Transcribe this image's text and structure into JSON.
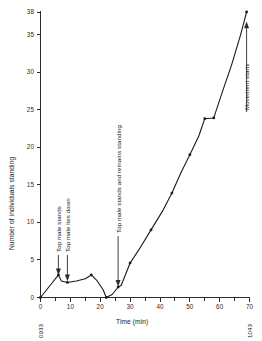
{
  "chart_data": {
    "type": "line",
    "title": "",
    "xlabel": "Time (min)",
    "ylabel": "Number of individuals standing",
    "xlim": [
      0,
      70
    ],
    "ylim": [
      0,
      38
    ],
    "grid": false,
    "legend": "none",
    "x_ticks": [
      0,
      10,
      20,
      30,
      40,
      50,
      60,
      70
    ],
    "x_tick_labels": [
      "0",
      "10",
      "20",
      "30",
      "40",
      "50",
      "60",
      "70"
    ],
    "x_minor_ticks": [
      5,
      15,
      25,
      35,
      45,
      55,
      65
    ],
    "y_ticks": [
      0,
      5,
      10,
      15,
      20,
      25,
      30,
      35,
      38
    ],
    "y_tick_labels": [
      "0",
      "5",
      "10",
      "15",
      "20",
      "25",
      "30",
      "35",
      "38"
    ],
    "x": [
      0,
      2,
      4,
      6,
      7,
      9,
      12,
      15,
      17,
      19,
      21,
      22,
      24,
      26,
      27,
      30,
      33,
      37,
      41,
      44,
      47,
      50,
      53,
      55,
      58,
      61,
      64,
      67,
      69
    ],
    "values": [
      0,
      1,
      2,
      3,
      2.2,
      2,
      2.2,
      2.5,
      3,
      2.2,
      1,
      0,
      0.4,
      1.4,
      1.6,
      4.6,
      6.4,
      9,
      11.6,
      13.9,
      16.6,
      19,
      21.5,
      23.8,
      23.9,
      27.5,
      31,
      35,
      38
    ],
    "marker_points": [
      {
        "x": 0,
        "y": 0
      },
      {
        "x": 6,
        "y": 3
      },
      {
        "x": 9,
        "y": 2
      },
      {
        "x": 17,
        "y": 3
      },
      {
        "x": 22,
        "y": 0
      },
      {
        "x": 26,
        "y": 1.4
      },
      {
        "x": 30,
        "y": 4.6
      },
      {
        "x": 37,
        "y": 9
      },
      {
        "x": 44,
        "y": 13.9
      },
      {
        "x": 50,
        "y": 19
      },
      {
        "x": 55,
        "y": 23.8
      },
      {
        "x": 58,
        "y": 23.9
      },
      {
        "x": 69,
        "y": 38
      }
    ],
    "annotations": [
      {
        "label": "Top male stands",
        "x": 6,
        "y": 3
      },
      {
        "label": "Top male lies down",
        "x": 9,
        "y": 2
      },
      {
        "label": "Top male stands and remains standing",
        "x": 26,
        "y": 1.4
      },
      {
        "label": "Movement starts",
        "x": 69,
        "y": 38
      }
    ],
    "corner_labels": {
      "start_time": "0933",
      "end_time": "1043"
    }
  }
}
